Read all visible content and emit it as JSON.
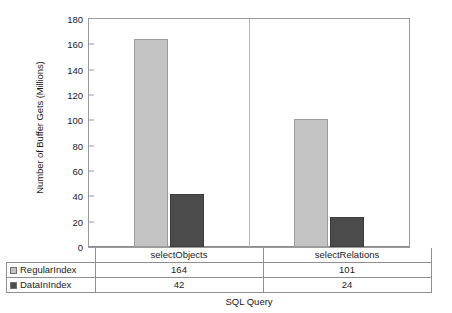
{
  "chart_data": {
    "type": "bar",
    "title": "",
    "xlabel": "SQL Query",
    "ylabel": "Number of Buffer Gets (Millions)",
    "categories": [
      "selectObjects",
      "selectRelations"
    ],
    "series": [
      {
        "name": "RegularIndex",
        "values": [
          164,
          101
        ],
        "color": "#c3c3c3"
      },
      {
        "name": "DataInIndex",
        "values": [
          42,
          24
        ],
        "color": "#4b4b4b"
      }
    ],
    "ylim": [
      0,
      180
    ],
    "yticks": [
      0,
      20,
      40,
      60,
      80,
      100,
      120,
      140,
      160,
      180
    ],
    "grid": false,
    "legend": "table-below",
    "axis_frame": true
  }
}
